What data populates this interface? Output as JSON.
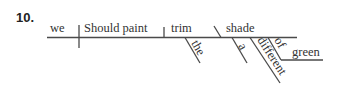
{
  "exercise": {
    "number": "10."
  },
  "sentence": {
    "subject": "we",
    "verb": "Should paint",
    "direct_object": "trim",
    "object_complement": "shade",
    "modifiers": {
      "the": "the",
      "a": "a",
      "different": "different",
      "of": "of",
      "green": "green"
    }
  },
  "colors": {
    "lines": "#4a4a4a",
    "text": "#333333",
    "number": "#222222",
    "background": "#ffffff"
  }
}
